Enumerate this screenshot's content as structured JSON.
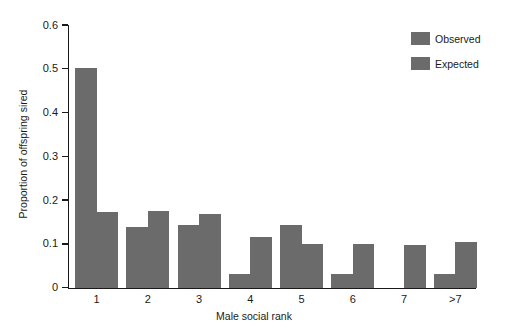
{
  "chart_data": {
    "type": "bar",
    "title": "",
    "xlabel": "Male social rank",
    "ylabel": "Proportion of offspring sired",
    "categories": [
      "1",
      "2",
      "3",
      "4",
      "5",
      "6",
      "7",
      ">7"
    ],
    "series": [
      {
        "name": "Observed",
        "color": "#6b6b6b",
        "values": [
          0.502,
          0.14,
          0.143,
          0.033,
          0.143,
          0.033,
          0.0,
          0.033
        ]
      },
      {
        "name": "Expected",
        "color": "#6b6b6b",
        "values": [
          0.174,
          0.175,
          0.168,
          0.117,
          0.101,
          0.1,
          0.098,
          0.106
        ]
      }
    ],
    "ylim": [
      0,
      0.6
    ],
    "yticks": [
      0,
      0.1,
      0.2,
      0.3,
      0.4,
      0.5,
      0.6
    ],
    "ytick_labels": [
      "0",
      "0.1",
      "0.2",
      "0.3",
      "0.4",
      "0.5",
      "0.6"
    ],
    "grid": false,
    "legend_position": "top-right",
    "legend": [
      "Observed",
      "Expected"
    ],
    "background_color": "#ffffff",
    "axis_color": "#1a1a1a"
  }
}
